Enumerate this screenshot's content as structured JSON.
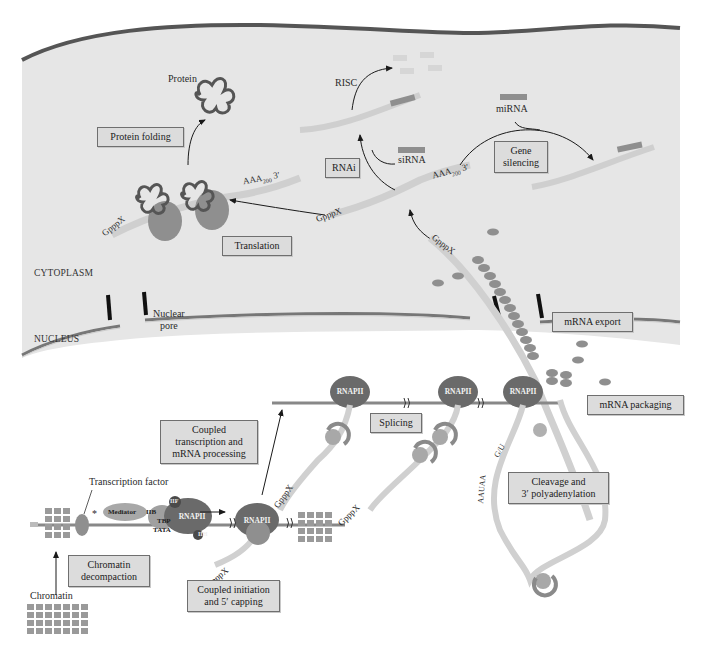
{
  "regions": {
    "cytoplasm": "CYTOPLASM",
    "nucleus": "NUCLEUS"
  },
  "process_boxes": {
    "protein_folding": "Protein folding",
    "translation": "Translation",
    "rnai": "RNAi",
    "gene_silencing": [
      "Gene",
      "silencing"
    ],
    "mrna_export": "mRNA export",
    "mrna_packaging": "mRNA packaging",
    "splicing": "Splicing",
    "coupled_transcription": [
      "Coupled",
      "transcription and",
      "mRNA processing"
    ],
    "cleavage": [
      "Cleavage and",
      "3′ polyadenylation"
    ],
    "chromatin_decompaction": [
      "Chromatin",
      "decompaction"
    ],
    "coupled_initiation": [
      "Coupled initiation",
      "and 5′ capping"
    ]
  },
  "labels": {
    "protein": "Protein",
    "risc": "RISC",
    "mirna": "miRNA",
    "sirna": "siRNA",
    "nuclear_pore": [
      "Nuclear",
      "pore"
    ],
    "transcription_factor": "Transcription factor",
    "chromatin": "Chromatin",
    "asterisk": "*",
    "cap": "GpppX",
    "five_prime": "5′",
    "three_prime": "3′",
    "polya": "AAA",
    "polya_sub": "200",
    "auaaa": "AAUAA",
    "gu": "G/U"
  },
  "complex": {
    "rnapii": "RNAPII",
    "mediator": "Mediator",
    "iib": "IIB",
    "tbp": "TBP",
    "tata": "TATA",
    "iif": "IIF",
    "iie": "IIE",
    "iih": "IIH"
  },
  "colors": {
    "cytoplasm_fill": "#e6e6e6",
    "membrane": "#5a5a5a",
    "mrna": "#cfcfcf",
    "ribosome": "#8f8f8f",
    "rnapii": "#6a6a6a",
    "chromatin": "#9a9a9a",
    "box_fill": "#dcdcdc"
  }
}
